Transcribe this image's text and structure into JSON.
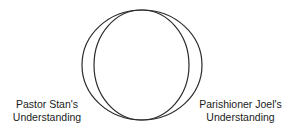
{
  "diagram": {
    "type": "overlapping-circles",
    "colors": {
      "stroke": "#2a2a2a",
      "background": "#ffffff",
      "text": "#1a1a1a"
    },
    "shapes": [
      {
        "id": "outer-ellipse",
        "cx": 142,
        "cy": 65,
        "rx": 60,
        "ry": 55
      },
      {
        "id": "inner-ellipse",
        "cx": 141.5,
        "cy": 65,
        "rx": 47.5,
        "ry": 55
      }
    ],
    "labels": {
      "left": {
        "line1": "Pastor Stan's",
        "line2": "Understanding"
      },
      "right": {
        "line1": "Parishioner Joel's",
        "line2": "Understanding"
      }
    }
  }
}
